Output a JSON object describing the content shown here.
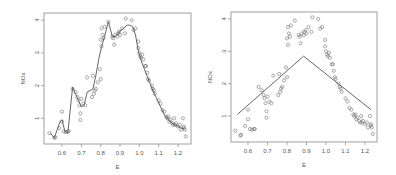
{
  "chart_data": [
    {
      "type": "scatter",
      "title": "",
      "xlabel": "E",
      "ylabel": "NOx",
      "xlim": [
        0.53,
        1.25
      ],
      "ylim": [
        0.2,
        4.15
      ],
      "xticks": [
        0.6,
        0.7,
        0.8,
        0.9,
        1.0,
        1.1,
        1.2
      ],
      "xtick_labels": [
        "0.6",
        "0.7",
        "0.8",
        "0.9",
        "1.0",
        "1.1",
        "1.2"
      ],
      "yticks": [
        1,
        2,
        3,
        4
      ],
      "ytick_labels": [
        "1",
        "2",
        "3",
        "4"
      ],
      "grid": false,
      "legend": null,
      "fit_line": {
        "name": "local regression (loess) fit",
        "x": [
          0.54,
          0.56,
          0.575,
          0.59,
          0.6,
          0.615,
          0.63,
          0.64,
          0.655,
          0.67,
          0.685,
          0.7,
          0.715,
          0.73,
          0.745,
          0.76,
          0.775,
          0.79,
          0.805,
          0.82,
          0.84,
          0.86,
          0.875,
          0.89,
          0.905,
          0.92,
          0.935,
          0.95,
          0.965,
          0.98,
          0.995,
          1.01,
          1.03,
          1.05,
          1.07,
          1.09,
          1.11,
          1.13,
          1.15,
          1.17,
          1.19,
          1.21,
          1.23
        ],
        "y": [
          0.55,
          0.4,
          0.65,
          0.9,
          0.95,
          0.6,
          0.55,
          1.1,
          1.95,
          1.75,
          1.55,
          1.35,
          1.4,
          1.8,
          1.85,
          1.9,
          2.3,
          2.8,
          3.2,
          3.5,
          3.95,
          3.5,
          3.5,
          3.6,
          3.7,
          3.75,
          3.85,
          3.85,
          3.8,
          3.55,
          3.05,
          2.75,
          2.45,
          2.15,
          1.85,
          1.6,
          1.35,
          1.1,
          0.95,
          0.85,
          0.78,
          0.72,
          0.68
        ]
      },
      "points": {
        "x": [
          0.535,
          0.56,
          0.565,
          0.585,
          0.6,
          0.6,
          0.61,
          0.62,
          0.63,
          0.635,
          0.655,
          0.67,
          0.68,
          0.685,
          0.69,
          0.695,
          0.695,
          0.7,
          0.71,
          0.72,
          0.73,
          0.755,
          0.76,
          0.765,
          0.77,
          0.775,
          0.785,
          0.795,
          0.8,
          0.8,
          0.805,
          0.805,
          0.81,
          0.815,
          0.82,
          0.84,
          0.86,
          0.865,
          0.87,
          0.875,
          0.885,
          0.89,
          0.895,
          0.9,
          0.91,
          0.925,
          0.93,
          0.96,
          0.97,
          0.98,
          0.995,
          0.995,
          1.0,
          1.005,
          1.01,
          1.015,
          1.02,
          1.03,
          1.035,
          1.04,
          1.045,
          1.05,
          1.065,
          1.07,
          1.075,
          1.08,
          1.1,
          1.11,
          1.12,
          1.13,
          1.14,
          1.145,
          1.15,
          1.155,
          1.16,
          1.17,
          1.175,
          1.18,
          1.185,
          1.19,
          1.2,
          1.21,
          1.215,
          1.225,
          1.23,
          1.23,
          1.235,
          1.24
        ],
        "y": [
          0.55,
          0.4,
          0.42,
          0.7,
          1.2,
          0.9,
          0.6,
          0.58,
          0.6,
          0.6,
          1.9,
          1.8,
          1.65,
          1.55,
          1.4,
          1.15,
          0.95,
          1.6,
          1.45,
          1.4,
          2.25,
          1.65,
          2.3,
          1.75,
          1.85,
          1.9,
          2.1,
          2.5,
          2.2,
          3.4,
          3.2,
          3.75,
          3.55,
          3.45,
          3.8,
          3.95,
          3.5,
          3.45,
          3.25,
          3.55,
          3.5,
          3.6,
          3.65,
          3.55,
          3.75,
          3.6,
          4.05,
          4.0,
          3.7,
          3.75,
          3.35,
          3.15,
          3.0,
          2.9,
          2.85,
          2.95,
          2.8,
          2.6,
          2.6,
          2.4,
          2.2,
          2.15,
          2.0,
          1.9,
          1.85,
          1.75,
          1.55,
          1.45,
          1.25,
          1.2,
          1.05,
          1.0,
          1.05,
          0.9,
          0.95,
          0.85,
          0.8,
          1.0,
          0.8,
          0.85,
          0.75,
          0.8,
          0.65,
          1.0,
          0.7,
          0.75,
          0.65,
          0.45
        ]
      },
      "frame_px": {
        "left": 44,
        "top": 13,
        "right": 191,
        "bottom": 144
      },
      "x_px_anchor": {
        "value": 0.6,
        "px": 62,
        "px_per_unit": 193.3
      },
      "y_px_anchor": {
        "value": 0,
        "px": 151,
        "px_per_unit": 32.7
      }
    },
    {
      "type": "scatter",
      "title": "",
      "xlabel": "E",
      "ylabel": "NOx",
      "xlim": [
        0.53,
        1.25
      ],
      "ylim": [
        0.2,
        4.15
      ],
      "xticks": [
        0.6,
        0.7,
        0.8,
        0.9,
        1.0,
        1.1,
        1.2
      ],
      "xtick_labels": [
        "0.6",
        "0.7",
        "0.8",
        "0.9",
        "1.0",
        "1.1",
        "1.2"
      ],
      "yticks": [
        1,
        2,
        3,
        4
      ],
      "ytick_labels": [
        "1",
        "2",
        "3",
        "4"
      ],
      "grid": false,
      "legend": null,
      "fit_line": {
        "name": "piecewise linear (broken-stick) fit",
        "x": [
          0.545,
          0.885,
          1.23
        ],
        "y": [
          1.05,
          2.85,
          1.2
        ]
      },
      "points": {
        "x": [
          0.535,
          0.56,
          0.565,
          0.585,
          0.6,
          0.6,
          0.61,
          0.62,
          0.63,
          0.635,
          0.655,
          0.67,
          0.68,
          0.685,
          0.69,
          0.695,
          0.695,
          0.7,
          0.71,
          0.72,
          0.73,
          0.755,
          0.76,
          0.765,
          0.77,
          0.775,
          0.785,
          0.795,
          0.8,
          0.8,
          0.805,
          0.805,
          0.81,
          0.815,
          0.82,
          0.84,
          0.86,
          0.865,
          0.87,
          0.875,
          0.885,
          0.89,
          0.895,
          0.9,
          0.91,
          0.925,
          0.93,
          0.96,
          0.97,
          0.98,
          0.995,
          0.995,
          1.0,
          1.005,
          1.01,
          1.015,
          1.02,
          1.03,
          1.035,
          1.04,
          1.045,
          1.05,
          1.065,
          1.07,
          1.075,
          1.08,
          1.1,
          1.11,
          1.12,
          1.13,
          1.14,
          1.145,
          1.15,
          1.155,
          1.16,
          1.17,
          1.175,
          1.18,
          1.185,
          1.19,
          1.2,
          1.21,
          1.215,
          1.225,
          1.23,
          1.23,
          1.235,
          1.24
        ],
        "y": [
          0.55,
          0.4,
          0.42,
          0.7,
          1.2,
          0.9,
          0.6,
          0.58,
          0.6,
          0.6,
          1.9,
          1.8,
          1.65,
          1.55,
          1.4,
          1.15,
          0.95,
          1.6,
          1.45,
          1.4,
          2.25,
          1.65,
          2.3,
          1.75,
          1.85,
          1.9,
          2.1,
          2.5,
          2.2,
          3.4,
          3.2,
          3.75,
          3.55,
          3.45,
          3.8,
          3.95,
          3.5,
          3.45,
          3.25,
          3.55,
          3.5,
          3.6,
          3.65,
          3.55,
          3.75,
          3.6,
          4.05,
          4.0,
          3.7,
          3.75,
          3.35,
          3.15,
          3.0,
          2.9,
          2.85,
          2.95,
          2.8,
          2.6,
          2.6,
          2.4,
          2.2,
          2.15,
          2.0,
          1.9,
          1.85,
          1.75,
          1.55,
          1.45,
          1.25,
          1.2,
          1.05,
          1.0,
          1.05,
          0.9,
          0.95,
          0.85,
          0.8,
          1.0,
          0.8,
          0.85,
          0.75,
          0.8,
          0.65,
          1.0,
          0.7,
          0.75,
          0.65,
          0.45
        ]
      },
      "frame_px": {
        "left": 231,
        "top": 12,
        "right": 377,
        "bottom": 142
      },
      "x_px_anchor": {
        "value": 0.6,
        "px": 248,
        "px_per_unit": 195.0
      },
      "y_px_anchor": {
        "value": 0,
        "px": 148.5,
        "px_per_unit": 32.4
      }
    }
  ],
  "colors": {
    "frame": "#888888",
    "points": "#666666",
    "line": "#555555",
    "text": "#555555"
  }
}
